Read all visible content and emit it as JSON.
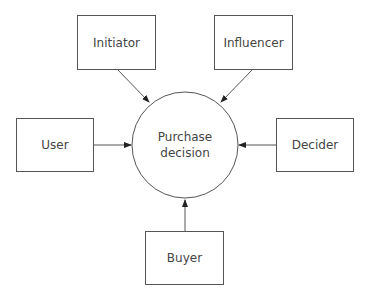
{
  "diagram": {
    "center": {
      "label_line1": "Purchase",
      "label_line2": "decision"
    },
    "nodes": [
      {
        "id": "initiator",
        "label": "Initiator"
      },
      {
        "id": "influencer",
        "label": "Influencer"
      },
      {
        "id": "user",
        "label": "User"
      },
      {
        "id": "decider",
        "label": "Decider"
      },
      {
        "id": "buyer",
        "label": "Buyer"
      }
    ],
    "edges": [
      {
        "from": "initiator",
        "to": "center"
      },
      {
        "from": "influencer",
        "to": "center"
      },
      {
        "from": "user",
        "to": "center"
      },
      {
        "from": "decider",
        "to": "center"
      },
      {
        "from": "buyer",
        "to": "center"
      }
    ],
    "colors": {
      "line": "#555555",
      "text": "#444444",
      "background": "#ffffff"
    }
  }
}
